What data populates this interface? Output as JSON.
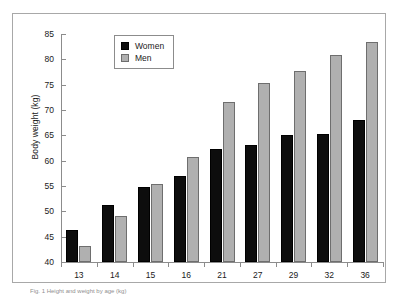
{
  "figure": {
    "caption": "Fig. 1 Height and weight by age (kg)"
  },
  "legend": {
    "position": "top-center",
    "entries": [
      {
        "label": "Women",
        "color": "#0d0d0d"
      },
      {
        "label": "Men",
        "color": "#b0b0b0"
      }
    ]
  },
  "axes": {
    "y_title": "Body weight (kg)",
    "y_ticks": [
      "40",
      "45",
      "50",
      "55",
      "60",
      "65",
      "70",
      "75",
      "80",
      "85"
    ],
    "x_ticks": [
      "13",
      "14",
      "15",
      "16",
      "21",
      "27",
      "29",
      "32",
      "36"
    ]
  },
  "chart_data": {
    "type": "bar",
    "title": "",
    "xlabel": "",
    "ylabel": "Body weight (kg)",
    "ylim": [
      40,
      85
    ],
    "ytick_step": 5,
    "grid": false,
    "legend_position": "top-center",
    "categories": [
      "13",
      "14",
      "15",
      "16",
      "21",
      "27",
      "29",
      "32",
      "36"
    ],
    "series": [
      {
        "name": "Women",
        "color": "#0d0d0d",
        "values": [
          46.4,
          51.3,
          54.8,
          57.0,
          62.4,
          63.1,
          65.0,
          65.2,
          68.0
        ]
      },
      {
        "name": "Men",
        "color": "#b0b0b0",
        "values": [
          43.2,
          49.0,
          55.4,
          60.8,
          71.5,
          75.3,
          77.7,
          80.9,
          83.5
        ]
      }
    ]
  }
}
